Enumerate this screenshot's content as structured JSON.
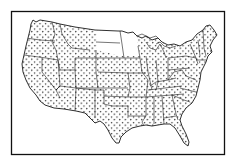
{
  "figure": {
    "type": "dot-map",
    "style": "black ink line drawing with stippled dot fill",
    "colors": {
      "background": "#ffffff",
      "ink": "#1a1a1a",
      "dots": "#222222",
      "frame": "#111111"
    },
    "blank_regions": [
      "North Dakota",
      "Minnesota"
    ],
    "frame": {
      "x": 11,
      "y": 11,
      "width": 214,
      "height": 144
    }
  }
}
